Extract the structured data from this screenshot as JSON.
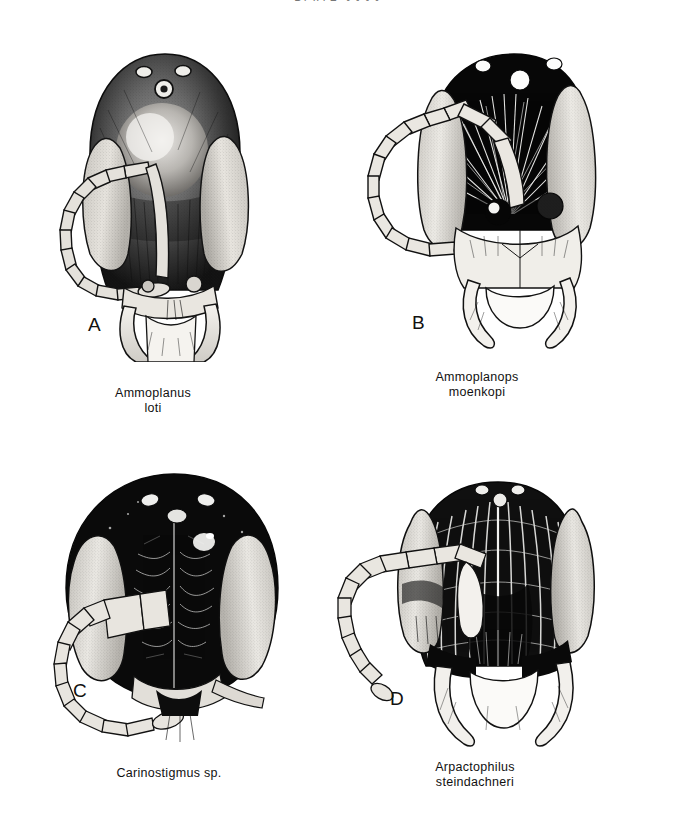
{
  "page": {
    "running_head": "PLATE XXXX",
    "background_color": "#ffffff",
    "ink_color": "#111111"
  },
  "plate": {
    "panels": [
      {
        "letter": "A",
        "taxon_lines": [
          "Ammoplanus",
          "loti"
        ],
        "genus": "Ammoplanus",
        "species": "loti",
        "view": "frontal head",
        "features": {
          "vertex": "dark stippled",
          "ocelli": 3,
          "ocelli_color": "#ffffff",
          "eyes": "large pale stippled compound eyes, lateral",
          "antenna": "12-segmented, curved into C-shaped loop to left",
          "mandibles": "pale, crossing below clypeus"
        }
      },
      {
        "letter": "B",
        "taxon_lines": [
          "Ammoplanops",
          "moenkopi"
        ],
        "genus": "Ammoplanops",
        "species": "moenkopi",
        "view": "frontal head",
        "features": {
          "vertex": "solid black",
          "ocelli": 3,
          "ocelli_color": "#ffffff",
          "eyes": "large pale stippled compound eyes, lateral",
          "antenna": "12-segmented, looped to left",
          "antennal_sockets": 2,
          "mandibles": "long curved pale mandibles"
        }
      },
      {
        "letter": "C",
        "taxon_lines": [
          "Carinostigmus sp."
        ],
        "genus": "Carinostigmus",
        "species": "sp.",
        "view": "frontal head",
        "features": {
          "vertex": "broad rounded, very dark",
          "ocelli": 3,
          "ocelli_color": "#f2f2f2",
          "eyes": "very large pale stippled compound eyes",
          "frons": "dark with vertical median line",
          "antenna": "12-segmented, angled down-left"
        }
      },
      {
        "letter": "D",
        "taxon_lines": [
          "Arpactophilus",
          "steindachneri"
        ],
        "genus": "Arpactophilus",
        "species": "steindachneri",
        "view": "frontal head",
        "features": {
          "vertex": "heavily carinate, longitudinal ridges",
          "ocelli": 3,
          "eyes": "pale stippled compound eyes, lateral",
          "antenna": "12-segmented, extended straight to left",
          "mandibles": "large curved sickle mandibles"
        }
      }
    ]
  }
}
